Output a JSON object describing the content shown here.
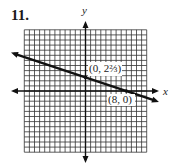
{
  "problem": {
    "number": "11."
  },
  "chart_data": {
    "type": "line",
    "title": "",
    "xlabel": "x",
    "ylabel": "y",
    "xlim": [
      -12,
      12
    ],
    "ylim": [
      -12,
      12
    ],
    "grid": true,
    "grid_step": 1,
    "series": [
      {
        "name": "line",
        "equation": "y = -x/3 + 8/3",
        "slope": -0.3333,
        "intercept": 2.6667,
        "arrows_both_ends": true
      }
    ],
    "points": [
      {
        "x": 0,
        "y": 2.6667,
        "label": "(0, 2⅔)"
      },
      {
        "x": 8,
        "y": 0,
        "label": "(8, 0)"
      }
    ]
  },
  "labels": {
    "x_axis": "x",
    "y_axis": "y",
    "point_a": "(0, 2⅔)",
    "point_b": "(8, 0)"
  },
  "colors": {
    "grid": "#333333",
    "line": "#111111",
    "label_bg": "#ffffff"
  }
}
